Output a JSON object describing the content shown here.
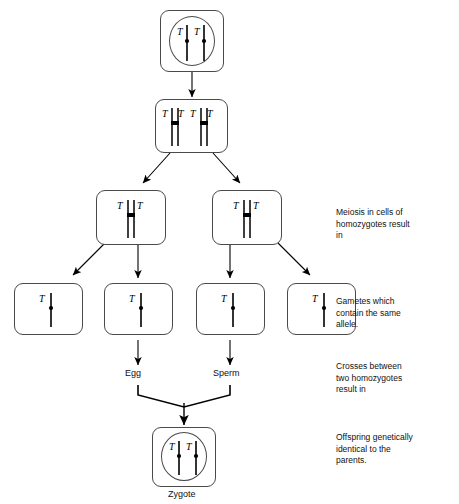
{
  "diagram": {
    "colors": {
      "background": "#ffffff",
      "outline": "#4a4a4a",
      "chromosome": "#000000",
      "text": "#111111"
    },
    "allele_symbol": "T"
  },
  "stages": {
    "parent_cell": {
      "name": "Parent cell",
      "alleles": [
        "T",
        "T"
      ],
      "chromosome_count": 2,
      "chromosome_type": "single"
    },
    "replicated_cell": {
      "name": "Cell after DNA replication",
      "alleles": [
        "T",
        "T",
        "T",
        "T"
      ],
      "chromosome_count": 2,
      "chromosome_type": "duplicated"
    },
    "daughter_cells": [
      {
        "name": "Daughter cell left",
        "alleles": [
          "T",
          "T"
        ],
        "chromosome_count": 1,
        "chromosome_type": "duplicated"
      },
      {
        "name": "Daughter cell right",
        "alleles": [
          "T",
          "T"
        ],
        "chromosome_count": 1,
        "chromosome_type": "duplicated"
      }
    ],
    "gametes": [
      {
        "name": "Gamete 1",
        "alleles": [
          "T"
        ],
        "chromosome_count": 1,
        "chromosome_type": "single",
        "label": ""
      },
      {
        "name": "Gamete 2",
        "alleles": [
          "T"
        ],
        "chromosome_count": 1,
        "chromosome_type": "single",
        "label": "Egg"
      },
      {
        "name": "Gamete 3",
        "alleles": [
          "T"
        ],
        "chromosome_count": 1,
        "chromosome_type": "single",
        "label": "Sperm"
      },
      {
        "name": "Gamete 4",
        "alleles": [
          "T"
        ],
        "chromosome_count": 1,
        "chromosome_type": "single",
        "label": ""
      }
    ],
    "zygote": {
      "name": "Zygote",
      "alleles": [
        "T",
        "T"
      ],
      "chromosome_count": 2,
      "chromosome_type": "single",
      "caption": "Zygote"
    }
  },
  "captions": {
    "egg": "Egg",
    "sperm": "Sperm",
    "zygote": "Zygote"
  },
  "annotations": [
    {
      "key": "meiosis",
      "text": "Meiosis in cells of\nhomozygotes result\nin"
    },
    {
      "key": "gametes",
      "text": "Gametes which\ncontain the same\nallele."
    },
    {
      "key": "crosses",
      "text": "Crosses between\ntwo homozygotes\nresult in"
    },
    {
      "key": "offspring",
      "text": "Offspring genetically\nidentical to the\nparents."
    }
  ],
  "alleles": {
    "parent_left": "T",
    "parent_right": "T",
    "repl_1": "T",
    "repl_2": "T",
    "repl_3": "T",
    "repl_4": "T",
    "daughterL_left": "T",
    "daughterL_right": "T",
    "daughterR_left": "T",
    "daughterR_right": "T",
    "gamete1": "T",
    "gamete2": "T",
    "gamete3": "T",
    "gamete4": "T",
    "zygote_left": "T",
    "zygote_right": "T"
  }
}
